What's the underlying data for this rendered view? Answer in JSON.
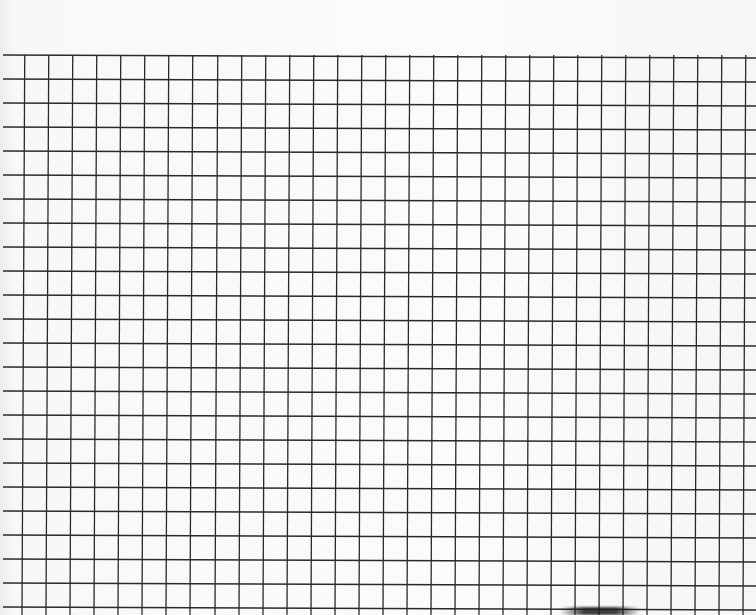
{
  "sheet": {
    "kind": "graph-paper",
    "line_color": "#2a2a2a",
    "paper_color": "#f9f9f7",
    "cell_size_px": 24,
    "grid_top_left": {
      "y": 55
    },
    "vertical_lines_x": [
      25,
      49,
      73,
      97,
      121,
      145,
      169,
      193,
      218,
      242,
      266,
      290,
      314,
      338,
      362,
      386,
      410,
      434,
      458,
      482,
      506,
      530,
      554,
      578,
      602,
      626,
      650,
      674,
      698,
      722,
      746
    ],
    "horizontal_lines_y": [
      56,
      80,
      104,
      128,
      152,
      176,
      200,
      224,
      248,
      272,
      296,
      320,
      344,
      368,
      392,
      416,
      440,
      464,
      488,
      512,
      536,
      560,
      584,
      608
    ],
    "tilt_dx_per_615px": -3,
    "tilt_dy_per_756px": 3
  }
}
